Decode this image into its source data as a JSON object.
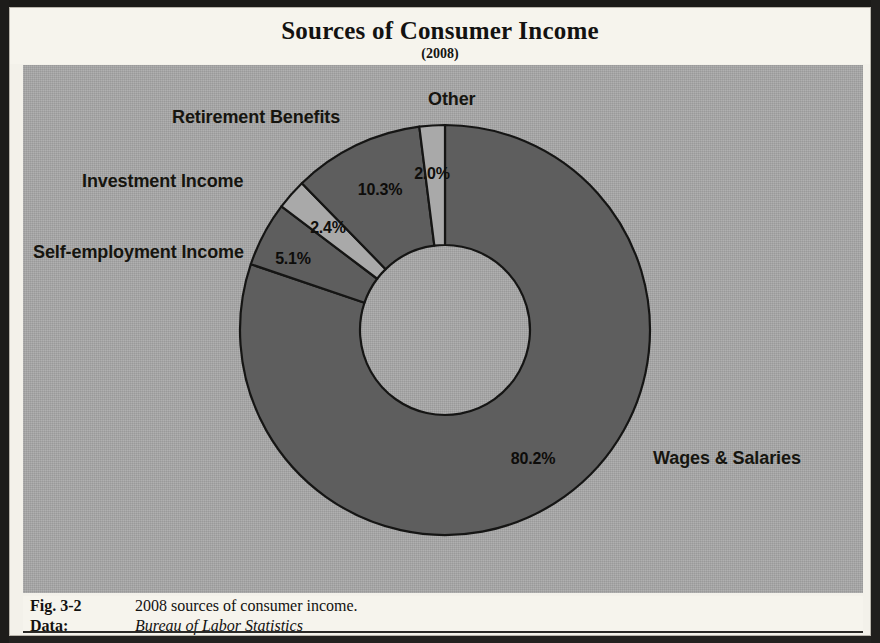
{
  "figure": {
    "title": "Sources of Consumer Income",
    "subtitle": "(2008)",
    "caption": {
      "fig_label": "Fig. 3-2",
      "fig_text": "2008 sources of consumer income.",
      "data_label": "Data:",
      "data_source": "Bureau of Labor Statistics"
    }
  },
  "colors": {
    "paper": "#f6f4ed",
    "plot_background": "#a7a7a7",
    "slice_dark": "#5e5e5e",
    "slice_light": "#a9a9a9",
    "slice_outline": "#151514",
    "text": "#14130f",
    "frame": "#1c1b19"
  },
  "chart_data": {
    "type": "pie",
    "variant": "donut",
    "title": "Sources of Consumer Income",
    "subtitle": "(2008)",
    "unit": "percent",
    "total": 100.0,
    "start_angle_deg": 0,
    "direction": "clockwise",
    "inner_radius_ratio": 0.415,
    "legend": "none (direct labels)",
    "categories": [
      "Wages & Salaries",
      "Self-employment Income",
      "Investment Income",
      "Retirement Benefits",
      "Other"
    ],
    "values": [
      80.2,
      5.1,
      2.4,
      10.3,
      2.0
    ],
    "slices": [
      {
        "label": "Wages & Salaries",
        "value": 80.2,
        "value_text": "80.2%",
        "shade": "dark",
        "value_label_x": 533,
        "value_label_y": 459,
        "name_label_x": 653,
        "name_label_y": 448
      },
      {
        "label": "Self-employment Income",
        "value": 5.1,
        "value_text": "5.1%",
        "shade": "dark",
        "value_label_x": 293,
        "value_label_y": 259,
        "name_label_x": 33,
        "name_label_y": 242
      },
      {
        "label": "Investment Income",
        "value": 2.4,
        "value_text": "2.4%",
        "shade": "light",
        "value_label_x": 328,
        "value_label_y": 228,
        "name_label_x": 82,
        "name_label_y": 171
      },
      {
        "label": "Retirement Benefits",
        "value": 10.3,
        "value_text": "10.3%",
        "shade": "dark",
        "value_label_x": 380,
        "value_label_y": 190,
        "name_label_x": 172,
        "name_label_y": 107
      },
      {
        "label": "Other",
        "value": 2.0,
        "value_text": "2.0%",
        "shade": "light",
        "value_label_x": 432,
        "value_label_y": 174,
        "name_label_x": 428,
        "name_label_y": 89
      }
    ],
    "geometry": {
      "center_x": 445,
      "center_y": 330,
      "outer_radius": 205,
      "inner_radius": 85
    }
  }
}
